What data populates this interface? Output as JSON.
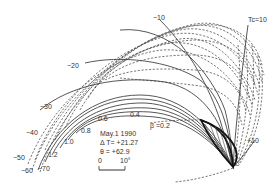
{
  "figure": {
    "kind": "nomogram-like curve diagram",
    "families": {
      "beta_curves": {
        "style": "solid",
        "labels": [
          "β =0.2",
          "0.4",
          "0.6",
          "0.8",
          "1.0",
          "1.2"
        ]
      },
      "tc_curves": {
        "style": "dashed+solid",
        "labels": [
          "Tc=10",
          "−10",
          "−20",
          "−30",
          "−40",
          "−50",
          "−60",
          "−70",
          "+10"
        ]
      }
    },
    "info_box": {
      "date": "May.1  1990",
      "delta_t": "Δ T=  +21.27",
      "theta": "θ   =  +62.9"
    },
    "scale_bar": {
      "start_label": "0",
      "end_label": "10°"
    },
    "labels": {
      "tc10": "Tc=10",
      "m10": "−10",
      "m20": "−20",
      "m30": "−30",
      "m40": "−40",
      "m50": "−50",
      "m60": "−60",
      "m70": "−70",
      "p10": "+10",
      "b02": "β =0.2",
      "b04": "0.4",
      "b06": "0.6",
      "b08": "0.8",
      "b10": "1.0",
      "b12": "1.2"
    },
    "colors": {
      "lines": "#444444",
      "bold_outline": "#111111",
      "text": "#333333",
      "background": "#ffffff"
    }
  }
}
